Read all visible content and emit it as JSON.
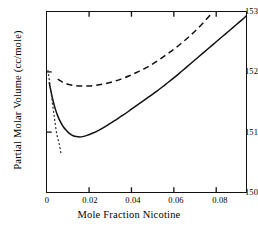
{
  "chart_data": {
    "type": "line",
    "title": "",
    "xlabel": "Mole Fraction Nicotine",
    "ylabel": "Partial Molar Volume (cc/mole)",
    "xlim": [
      0,
      0.0942
    ],
    "ylim": [
      150,
      153
    ],
    "xticks": [
      0,
      0.02,
      0.04,
      0.06,
      0.08
    ],
    "xtick_labels": [
      "0",
      "0.02",
      "0.04",
      "0.06",
      "0.08"
    ],
    "yticks": [
      150,
      151,
      152,
      153
    ],
    "ytick_labels": [
      "150",
      "151",
      "152",
      "153"
    ],
    "grid": false,
    "legend": null,
    "frame": "box",
    "tick_direction": "in",
    "ticks_on": [
      "bottom",
      "left",
      "top"
    ],
    "series": [
      {
        "name": "solid-curve",
        "style": "solid",
        "color": "#111111",
        "x": [
          0.0012,
          0.002,
          0.003,
          0.004,
          0.0052,
          0.0065,
          0.008,
          0.0095,
          0.011,
          0.0125,
          0.014,
          0.0155,
          0.017,
          0.019,
          0.0215,
          0.0245,
          0.028,
          0.032,
          0.036,
          0.04,
          0.044,
          0.048,
          0.052,
          0.056,
          0.06,
          0.064,
          0.068,
          0.072,
          0.076,
          0.08,
          0.084,
          0.088,
          0.092,
          0.0942
        ],
        "y": [
          151.82,
          151.68,
          151.52,
          151.39,
          151.27,
          151.17,
          151.08,
          151.02,
          150.97,
          150.94,
          150.925,
          150.92,
          150.925,
          150.945,
          150.98,
          151.03,
          151.1,
          151.19,
          151.28,
          151.38,
          151.48,
          151.58,
          151.68,
          151.79,
          151.9,
          152.02,
          152.14,
          152.26,
          152.38,
          152.5,
          152.62,
          152.74,
          152.86,
          152.93
        ]
      },
      {
        "name": "dashed-curve",
        "style": "dashed",
        "color": "#111111",
        "x": [
          0.0052,
          0.0075,
          0.01,
          0.013,
          0.016,
          0.0195,
          0.023,
          0.027,
          0.031,
          0.035,
          0.039,
          0.043,
          0.047,
          0.051,
          0.055,
          0.059,
          0.063,
          0.067,
          0.071,
          0.075,
          0.0775
        ],
        "y": [
          151.88,
          151.83,
          151.795,
          151.775,
          151.765,
          151.765,
          151.775,
          151.8,
          151.835,
          151.88,
          151.935,
          152.0,
          152.07,
          152.155,
          152.25,
          152.35,
          152.46,
          152.58,
          152.71,
          152.86,
          152.96
        ]
      },
      {
        "name": "dotted-curve",
        "style": "dotted",
        "color": "#333333",
        "x": [
          0.0006,
          0.0012,
          0.0022,
          0.0034,
          0.0046,
          0.0055,
          0.006,
          0.0063,
          0.0065,
          0.0066,
          0.0067
        ],
        "y": [
          152.02,
          151.88,
          151.62,
          151.3,
          151.0,
          150.86,
          150.79,
          150.735,
          150.7,
          150.675,
          150.66
        ]
      }
    ]
  }
}
